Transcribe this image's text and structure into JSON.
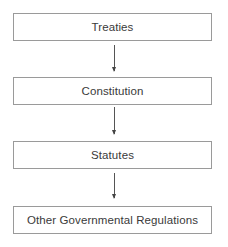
{
  "diagram": {
    "type": "flowchart",
    "direction": "top-to-bottom",
    "nodes": [
      {
        "id": "treaties",
        "label": "Treaties"
      },
      {
        "id": "constitution",
        "label": "Constitution"
      },
      {
        "id": "statutes",
        "label": "Statutes"
      },
      {
        "id": "other",
        "label": "Other Governmental Regulations"
      }
    ],
    "edges": [
      {
        "from": "treaties",
        "to": "constitution"
      },
      {
        "from": "constitution",
        "to": "statutes"
      },
      {
        "from": "statutes",
        "to": "other"
      }
    ],
    "colors": {
      "border": "#9a9a9a",
      "text": "#3a3a3a",
      "arrow": "#444444"
    }
  }
}
